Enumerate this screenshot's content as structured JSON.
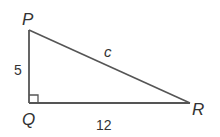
{
  "diagram": {
    "type": "right-triangle",
    "vertices": {
      "P": {
        "label": "P",
        "x": 29,
        "y": 30
      },
      "Q": {
        "label": "Q",
        "x": 29,
        "y": 103
      },
      "R": {
        "label": "R",
        "x": 190,
        "y": 103
      }
    },
    "sides": {
      "PQ": {
        "label": "5"
      },
      "QR": {
        "label": "12"
      },
      "PR": {
        "label": "c"
      }
    },
    "right_angle_at": "Q",
    "colors": {
      "line": "#555555",
      "text": "#333333",
      "background": "#ffffff"
    }
  }
}
